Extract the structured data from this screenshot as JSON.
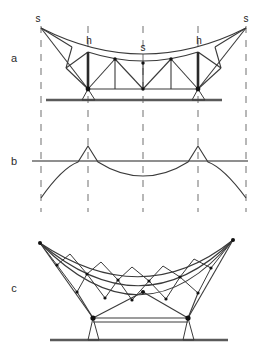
{
  "figure": {
    "background_color": "#ffffff",
    "line_color": "#3a3a3a",
    "heavy_line_color": "#4a4a4a",
    "dash_color": "#7d7d7d",
    "node_color": "#111111",
    "width": 264,
    "height": 361
  },
  "panels": [
    {
      "id": "a",
      "label": "a",
      "label_x": 14,
      "label_y": 62,
      "description": "Elevation of stayed truss with two masts, backstays to anchors and straight ground line"
    },
    {
      "id": "b",
      "label": "b",
      "label_x": 14,
      "label_y": 165,
      "description": "Bending moment diagram with peaks over masts and sag at midspan"
    },
    {
      "id": "c",
      "label": "c",
      "label_x": 14,
      "label_y": 292,
      "description": "Deep curved cable-truss with three chords and zigzag web on two supports"
    }
  ],
  "annotations": [
    {
      "text": "s",
      "x": 38,
      "y": 22,
      "panel": "a",
      "meaning": "anchor-stay-left"
    },
    {
      "text": "h",
      "x": 89,
      "y": 44,
      "panel": "a",
      "meaning": "mast-height-left"
    },
    {
      "text": "s",
      "x": 143,
      "y": 51,
      "panel": "a",
      "meaning": "span-midpoint"
    },
    {
      "text": "h",
      "x": 199,
      "y": 44,
      "panel": "a",
      "meaning": "mast-height-right"
    },
    {
      "text": "s",
      "x": 246,
      "y": 22,
      "panel": "a",
      "meaning": "anchor-stay-right"
    }
  ],
  "grid": {
    "dash_lines_x": [
      41,
      88,
      143,
      198,
      246
    ],
    "dash_top": 26,
    "dash_bottom": 212,
    "dash_pattern": "7 7"
  },
  "panel_a": {
    "ground_y": 100,
    "ground_x1": 46,
    "ground_x2": 222,
    "deck_y": 89,
    "mast_top_y": 52,
    "mast_left_x": 88,
    "mast_right_x": 198,
    "anchor_left": {
      "x": 41,
      "y": 28
    },
    "anchor_right": {
      "x": 246,
      "y": 28
    },
    "support_left": {
      "x": 88,
      "y": 89
    },
    "support_right": {
      "x": 198,
      "y": 89
    },
    "top_chord_nodes_x": [
      88,
      115,
      143,
      171,
      198
    ],
    "bottom_chord_nodes_x": [
      88,
      115,
      143,
      171,
      198
    ],
    "cable_sag_mid_y": 62
  },
  "panel_b": {
    "baseline_y": 161,
    "baseline_x1": 32,
    "baseline_x2": 248,
    "peak_left_x": 88,
    "peak_right_x": 198,
    "peak_y": 146,
    "sag_mid_x": 143,
    "sag_mid_y": 176,
    "end_drop_y": 198
  },
  "panel_c": {
    "tip_left": {
      "x": 40,
      "y": 243
    },
    "tip_right": {
      "x": 233,
      "y": 240
    },
    "chord_count": 3,
    "support_left": {
      "x": 93,
      "y": 318
    },
    "support_right": {
      "x": 188,
      "y": 318
    },
    "ground_y": 340,
    "ground_x1": 50,
    "ground_x2": 228,
    "apex_x": 143,
    "apex_y": 292
  }
}
